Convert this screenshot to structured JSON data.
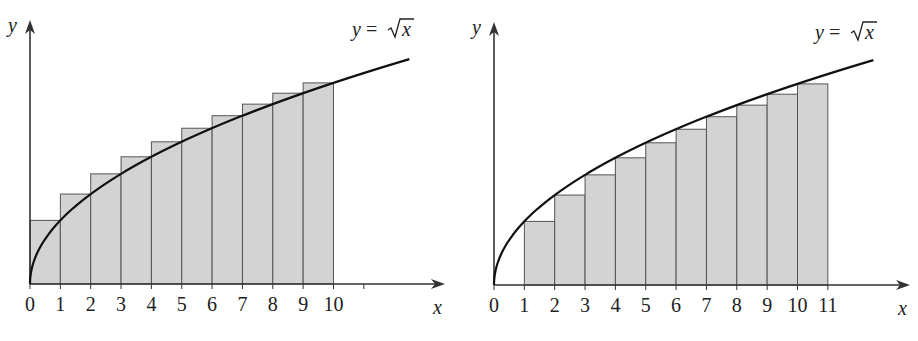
{
  "chart_data": [
    {
      "type": "bar",
      "title": "",
      "curve_label": "y = √x",
      "xlabel": "x",
      "ylabel": "y",
      "x_ticks": [
        "0",
        "1",
        "2",
        "3",
        "4",
        "5",
        "6",
        "7",
        "8",
        "9",
        "10"
      ],
      "x_range": [
        0,
        13.5
      ],
      "bars": [
        {
          "x0": 0,
          "x1": 1,
          "height": 1.0
        },
        {
          "x0": 1,
          "x1": 2,
          "height": 1.414
        },
        {
          "x0": 2,
          "x1": 3,
          "height": 1.732
        },
        {
          "x0": 3,
          "x1": 4,
          "height": 2.0
        },
        {
          "x0": 4,
          "x1": 5,
          "height": 2.236
        },
        {
          "x0": 5,
          "x1": 6,
          "height": 2.449
        },
        {
          "x0": 6,
          "x1": 7,
          "height": 2.646
        },
        {
          "x0": 7,
          "x1": 8,
          "height": 2.828
        },
        {
          "x0": 8,
          "x1": 9,
          "height": 3.0
        },
        {
          "x0": 9,
          "x1": 10,
          "height": 3.162
        }
      ],
      "curve": {
        "function": "sqrt",
        "x_start": 0,
        "x_end": 12.5
      },
      "note": "Right-endpoint rectangles (overestimate)"
    },
    {
      "type": "bar",
      "title": "",
      "curve_label": "y = √x",
      "xlabel": "x",
      "ylabel": "y",
      "x_ticks": [
        "0",
        "1",
        "2",
        "3",
        "4",
        "5",
        "6",
        "7",
        "8",
        "9",
        "10",
        "11"
      ],
      "x_range": [
        0,
        13.5
      ],
      "bars": [
        {
          "x0": 1,
          "x1": 2,
          "height": 1.0
        },
        {
          "x0": 2,
          "x1": 3,
          "height": 1.414
        },
        {
          "x0": 3,
          "x1": 4,
          "height": 1.732
        },
        {
          "x0": 4,
          "x1": 5,
          "height": 2.0
        },
        {
          "x0": 5,
          "x1": 6,
          "height": 2.236
        },
        {
          "x0": 6,
          "x1": 7,
          "height": 2.449
        },
        {
          "x0": 7,
          "x1": 8,
          "height": 2.646
        },
        {
          "x0": 8,
          "x1": 9,
          "height": 2.828
        },
        {
          "x0": 9,
          "x1": 10,
          "height": 3.0
        },
        {
          "x0": 10,
          "x1": 11,
          "height": 3.162
        }
      ],
      "curve": {
        "function": "sqrt",
        "x_start": 0,
        "x_end": 12.5
      },
      "note": "Left-endpoint rectangles on [1,11] (underestimate)"
    }
  ],
  "colors": {
    "bar_fill": "#d3d3d3",
    "bar_stroke": "#555555",
    "curve": "#111111",
    "axis": "#333333"
  },
  "left": {
    "ylabel": "y",
    "xlabel": "x",
    "curve_label_prefix": "y = ",
    "curve_label_var": "x"
  },
  "right": {
    "ylabel": "y",
    "xlabel": "x",
    "curve_label_prefix": "y = ",
    "curve_label_var": "x"
  }
}
